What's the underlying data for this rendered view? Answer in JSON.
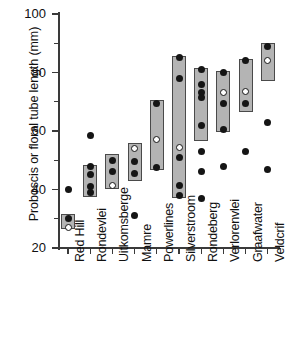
{
  "chart_data": {
    "type": "scatter",
    "title": "",
    "xlabel": "",
    "ylabel": "Proboscis or floral tube length (mm)",
    "ylim": [
      20,
      100
    ],
    "ytick_labels": [
      "100",
      "80",
      "60",
      "40",
      "20"
    ],
    "ytick_values": [
      100,
      80,
      60,
      40,
      20
    ],
    "yminor_values": [
      90,
      70,
      50,
      30
    ],
    "grid": false,
    "legend": null,
    "categories": [
      "Red Hill",
      "Rondevlei",
      "Uitkomsberge",
      "Mamre",
      "Powerlines",
      "Silverstroom",
      "Rondeberg",
      "Verlorenvlei",
      "Graafwater",
      "Veldcrif"
    ],
    "series": [
      {
        "name": "Red Hill",
        "box": [
          26.5,
          31.5
        ],
        "points_filled": [
          40.0,
          30.0
        ],
        "points_open": [
          27.0
        ]
      },
      {
        "name": "Rondevlei",
        "box": [
          37.5,
          48.5
        ],
        "points_filled": [
          58.5,
          48.0,
          45.0,
          41.0,
          39.0
        ],
        "points_open": []
      },
      {
        "name": "Uitkomsberge",
        "box": [
          40.0,
          52.0
        ],
        "points_filled": [
          50.0,
          46.0
        ],
        "points_open": [
          41.5
        ]
      },
      {
        "name": "Mamre",
        "box": [
          43.0,
          56.0
        ],
        "points_filled": [
          49.5,
          45.5,
          31.0
        ],
        "points_open": [
          54.0
        ]
      },
      {
        "name": "Powerlines",
        "box": [
          46.5,
          70.5
        ],
        "points_filled": [
          69.5,
          47.5
        ],
        "points_open": [
          57.0
        ]
      },
      {
        "name": "Silverstroom",
        "box": [
          37.0,
          85.5
        ],
        "points_filled": [
          85.0,
          78.0,
          51.0,
          41.5,
          38.0
        ],
        "points_open": [
          54.5
        ]
      },
      {
        "name": "Rondeberg",
        "box": [
          56.5,
          81.5
        ],
        "points_filled": [
          81.0,
          76.0,
          73.0,
          71.5,
          62.0,
          53.0,
          46.0,
          37.0
        ],
        "points_open": []
      },
      {
        "name": "Verlorenvlei",
        "box": [
          59.5,
          80.5
        ],
        "points_filled": [
          80.0,
          69.5,
          60.5,
          48.0
        ],
        "points_open": [
          73.0
        ]
      },
      {
        "name": "Graafwater",
        "box": [
          66.5,
          84.5
        ],
        "points_filled": [
          84.0,
          69.5,
          53.0
        ],
        "points_open": [
          73.5
        ]
      },
      {
        "name": "Veldcrif",
        "box": [
          77.0,
          90.0
        ],
        "points_filled": [
          89.0,
          63.0,
          47.0
        ],
        "points_open": [
          84.0
        ]
      }
    ]
  },
  "colors": {
    "box_fill": "#b4b4b4",
    "box_stroke": "#4a4a4a",
    "point_filled": "#151515",
    "point_open": "#ffffff",
    "axis": "#3a3a3a",
    "background": "#ffffff"
  }
}
